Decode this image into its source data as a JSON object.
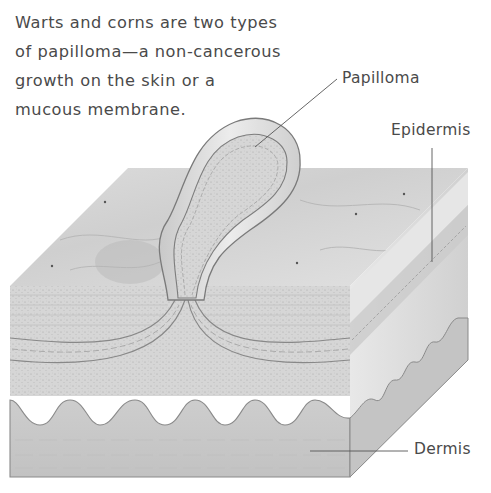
{
  "caption": {
    "lines": [
      "Warts and corns are two types",
      "of papilloma—a non-cancerous",
      "growth on the skin or a",
      "mucous membrane."
    ]
  },
  "labels": {
    "papilloma": "Papilloma",
    "epidermis": "Epidermis",
    "dermis": "Dermis"
  },
  "colors": {
    "text": "#4a4a4a",
    "leader_line": "#555555",
    "skin_top": "#d9d9d9",
    "skin_front_upper": "#dcdcdc",
    "dermis": "#c8c8c8",
    "cell_layer": "#9a9a9a"
  }
}
